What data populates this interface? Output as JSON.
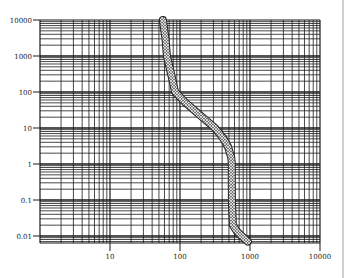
{
  "chart_data": {
    "type": "line",
    "title": "",
    "xlabel": "",
    "ylabel": "",
    "xscale": "log",
    "yscale": "log",
    "xlim": [
      1,
      10000
    ],
    "ylim": [
      0.006,
      10000
    ],
    "grid": true,
    "legend": null,
    "x_tick_labels": [
      "10",
      "100",
      "1000",
      "10000"
    ],
    "y_tick_labels": [
      "10000",
      "1000",
      "100",
      "10",
      "1",
      "0.1",
      "0.01"
    ],
    "series": [
      {
        "name": "band",
        "style": "hatched thick band",
        "x": [
          57,
          62,
          65,
          75,
          85,
          120,
          163,
          230,
          316,
          420,
          485,
          540,
          550,
          550,
          552,
          570,
          640,
          720,
          930
        ],
        "y": [
          10000,
          3000,
          1000,
          300,
          100,
          50,
          30,
          17,
          10,
          5,
          3,
          1.5,
          1,
          0.3,
          0.1,
          0.02,
          0.014,
          0.011,
          0.007
        ]
      }
    ]
  },
  "colors": {
    "grid": "#1a1a1a",
    "band": "#222222",
    "background": "#ffffff"
  }
}
